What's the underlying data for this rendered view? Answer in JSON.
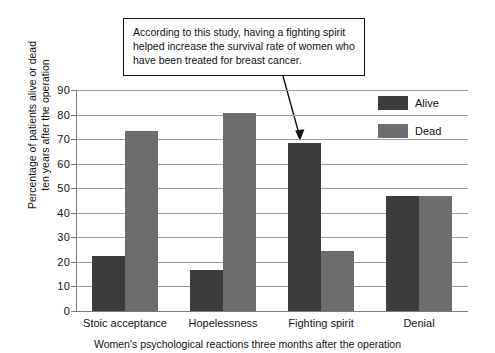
{
  "chart_data": {
    "type": "bar",
    "title": "",
    "xlabel": "Women's psychological reactions three months after the operation",
    "ylabel_lines": [
      "Percentage of patients alive or dead",
      "ten years after the operation"
    ],
    "categories": [
      "Stoic acceptance",
      "Hopelessness",
      "Fighting spirit",
      "Denial"
    ],
    "series": [
      {
        "name": "Alive",
        "color": "#3c3c3c",
        "values": [
          22.5,
          16.5,
          68.5,
          47
        ]
      },
      {
        "name": "Dead",
        "color": "#6d6d6d",
        "values": [
          73.5,
          80.5,
          24.5,
          47
        ]
      }
    ],
    "ylim": [
      0,
      90
    ],
    "ytick_step": 10,
    "yticks": [
      0,
      10,
      20,
      30,
      40,
      50,
      60,
      70,
      80,
      90
    ],
    "grid": true,
    "legend_position": "top-right",
    "annotations": [
      {
        "text": "According to this study, having a fighting spirit helped increase the survival rate of women who have been treated for breast cancer.",
        "lines": [
          "According to this study, having a fighting spirit",
          "helped increase the survival rate of women who",
          "have been treated for breast cancer."
        ],
        "points_to": {
          "category": "Fighting spirit",
          "series": "Alive",
          "value": 68.5
        }
      }
    ]
  },
  "legend": {
    "items": [
      {
        "label": "Alive"
      },
      {
        "label": "Dead"
      }
    ]
  }
}
